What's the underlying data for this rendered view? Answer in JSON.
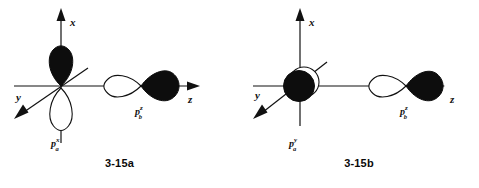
{
  "figure": {
    "panels": [
      {
        "id": "3-15a",
        "caption": "3-15a",
        "axes": [
          {
            "name": "x",
            "label": "x",
            "direction": "up"
          },
          {
            "name": "y",
            "label": "y",
            "direction": "down-left"
          },
          {
            "name": "z",
            "label": "z",
            "direction": "right"
          }
        ],
        "orbitals": [
          {
            "name": "p-a",
            "label_base": "p",
            "label_sub": "a",
            "label_sup": "x",
            "orientation": "vertical",
            "filled_lobe": "up",
            "open_lobe": "down"
          },
          {
            "name": "p-b",
            "label_base": "p",
            "label_sub": "b",
            "label_sup": "z",
            "orientation": "horizontal",
            "filled_lobe": "right",
            "open_lobe": "left"
          }
        ]
      },
      {
        "id": "3-15b",
        "caption": "3-15b",
        "axes": [
          {
            "name": "x",
            "label": "x",
            "direction": "up"
          },
          {
            "name": "y",
            "label": "y",
            "direction": "down-left"
          },
          {
            "name": "z",
            "label": "z",
            "direction": "right"
          }
        ],
        "orbitals": [
          {
            "name": "p-a",
            "label_base": "p",
            "label_sub": "a",
            "label_sup": "y",
            "orientation": "end-on",
            "filled_lobe": "front",
            "open_lobe": "back"
          },
          {
            "name": "p-b",
            "label_base": "p",
            "label_sub": "b",
            "label_sup": "z",
            "orientation": "horizontal",
            "filled_lobe": "right",
            "open_lobe": "left"
          }
        ]
      }
    ],
    "colors": {
      "ink": "#111111",
      "filled_lobe": "#0d0d0d",
      "open_lobe": "#ffffff",
      "background": "#ffffff"
    }
  }
}
